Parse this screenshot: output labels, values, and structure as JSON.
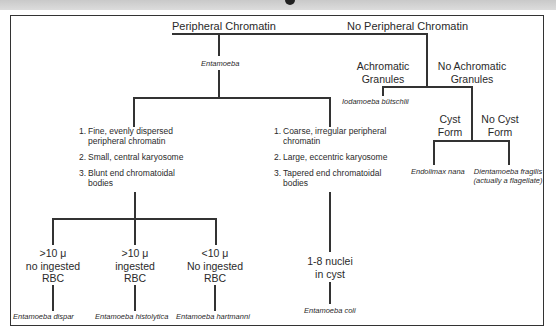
{
  "header": {
    "clipped_title_fragment": ""
  },
  "diagram": {
    "root_left": "Peripheral Chromatin",
    "root_right": "No Peripheral Chromatin",
    "genus_left": "Entamoeba",
    "achromatic": {
      "line1": "Achromatic",
      "line2": "Granules"
    },
    "no_achromatic": {
      "line1": "No Achromatic",
      "line2": "Granules"
    },
    "iodamoeba": "Iodamoeba bütschlii",
    "cyst_form": {
      "line1": "Cyst",
      "line2": "Form"
    },
    "no_cyst_form": {
      "line1": "No Cyst",
      "line2": "Form"
    },
    "endolimax": "Endolimax nana",
    "dientamoeba": {
      "line1": "Dientamoeba fragilis",
      "line2": "(actually a flagellate)"
    },
    "group_a": {
      "items": [
        {
          "num": "1.",
          "line1": "Fine, evenly dispersed",
          "line2": "peripheral chromatin"
        },
        {
          "num": "2.",
          "line1": "Small, central karyosome",
          "line2": ""
        },
        {
          "num": "3.",
          "line1": "Blunt end chromatoidal",
          "line2": "bodies"
        }
      ]
    },
    "group_b": {
      "items": [
        {
          "num": "1.",
          "line1": "Coarse, irregular peripheral",
          "line2": "chromatin"
        },
        {
          "num": "2.",
          "line1": "Large, eccentric karyosome",
          "line2": ""
        },
        {
          "num": "3.",
          "line1": "Tapered end chromatoidal",
          "line2": "bodies"
        }
      ]
    },
    "leaf_a1": {
      "line1": ">10 μ",
      "line2": "no ingested",
      "line3": "RBC",
      "species": "Entamoeba dispar"
    },
    "leaf_a2": {
      "line1": ">10 μ",
      "line2": "ingested",
      "line3": "RBC",
      "species": "Entamoeba histolytica"
    },
    "leaf_a3": {
      "line1": "<10 μ",
      "line2": "No ingested",
      "line3": "RBC",
      "species": "Entamoeba hartmanni"
    },
    "leaf_b": {
      "line1": "1-8 nuclei",
      "line2": "in cyst",
      "species": "Entamoeba coli"
    }
  },
  "colors": {
    "line": "#333333",
    "text": "#2a2a2a",
    "strip": "#d0d0d0"
  }
}
